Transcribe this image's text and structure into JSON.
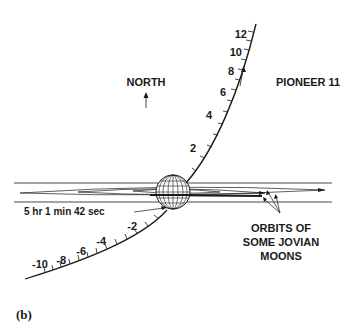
{
  "diagram": {
    "labels": {
      "north": "NORTH",
      "spacecraft": "PIONEER 11",
      "closest_approach_time": "5 hr  1 min  42 sec",
      "orbits_line1": "ORBITS OF",
      "orbits_line2": "SOME JOVIAN",
      "orbits_line3": "MOONS"
    },
    "caption": "(b)",
    "inbound_ticks": [
      "-2",
      "-4",
      "-6",
      "-8",
      "-10"
    ],
    "outbound_ticks": [
      "2",
      "4",
      "6",
      "8",
      "10",
      "12"
    ],
    "colors": {
      "ink": "#1a1a1a",
      "background": "#ffffff"
    }
  }
}
